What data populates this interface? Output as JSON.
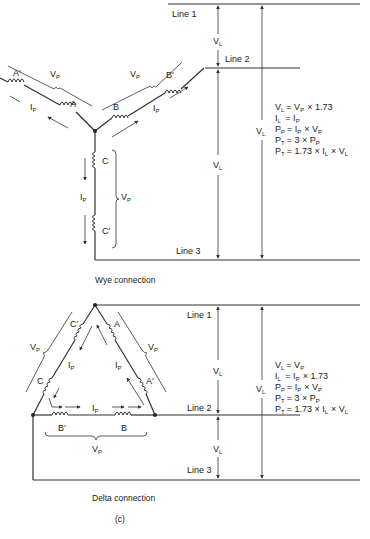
{
  "wye": {
    "caption": "Wye connection",
    "lines": {
      "line1": "Line 1",
      "line2": "Line 2",
      "line3": "Line 3"
    },
    "coils": {
      "a": "A",
      "a_prime": "A′",
      "b": "B",
      "b_prime": "B′",
      "c": "C",
      "c_prime": "C′"
    },
    "labels": {
      "vp": "V",
      "vp_sub": "P",
      "ip": "I",
      "ip_sub": "P",
      "vl": "V",
      "vl_sub": "L"
    },
    "formulas": [
      {
        "lhs": "V",
        "lhs_sub": "L",
        "rhs": "= V",
        "rhs_sub": "P",
        "tail": "× 1.73"
      },
      {
        "lhs": "I",
        "lhs_sub": "L",
        "rhs": " = I",
        "rhs_sub": "P",
        "tail": ""
      },
      {
        "lhs": "P",
        "lhs_sub": "P",
        "rhs": "= I",
        "rhs_sub": "P",
        "tail": "× V",
        "tail_sub": "P"
      },
      {
        "lhs": "P",
        "lhs_sub": "T",
        "rhs": "= 3 × P",
        "rhs_sub": "P",
        "tail": ""
      },
      {
        "lhs": "P",
        "lhs_sub": "T",
        "rhs": "= 1.73 × I",
        "rhs_sub": "L",
        "tail": "× V",
        "tail_sub": "L"
      }
    ]
  },
  "delta": {
    "caption": "Delta connection",
    "lines": {
      "line1": "Line 1",
      "line2": "Line 2",
      "line3": "Line 3"
    },
    "coils": {
      "a": "A",
      "a_prime": "A′",
      "b": "B",
      "b_prime": "B′",
      "c": "C",
      "c_prime": "C′"
    },
    "labels": {
      "vp": "V",
      "vp_sub": "P",
      "ip": "I",
      "ip_sub": "P",
      "vl": "V",
      "vl_sub": "L"
    },
    "formulas": [
      {
        "lhs": "V",
        "lhs_sub": "L",
        "rhs": "= V",
        "rhs_sub": "P",
        "tail": ""
      },
      {
        "lhs": "I",
        "lhs_sub": "L",
        "rhs": " = I",
        "rhs_sub": "P",
        "tail": "× 1.73"
      },
      {
        "lhs": "P",
        "lhs_sub": "P",
        "rhs": "= I",
        "rhs_sub": "P",
        "tail": "× V",
        "tail_sub": "P"
      },
      {
        "lhs": "P",
        "lhs_sub": "T",
        "rhs": "= 3 × P",
        "rhs_sub": "P",
        "tail": ""
      },
      {
        "lhs": "P",
        "lhs_sub": "T",
        "rhs": "= 1.73 × I",
        "rhs_sub": "L",
        "tail": "× V",
        "tail_sub": "L"
      }
    ]
  },
  "figure_label": "(c)"
}
